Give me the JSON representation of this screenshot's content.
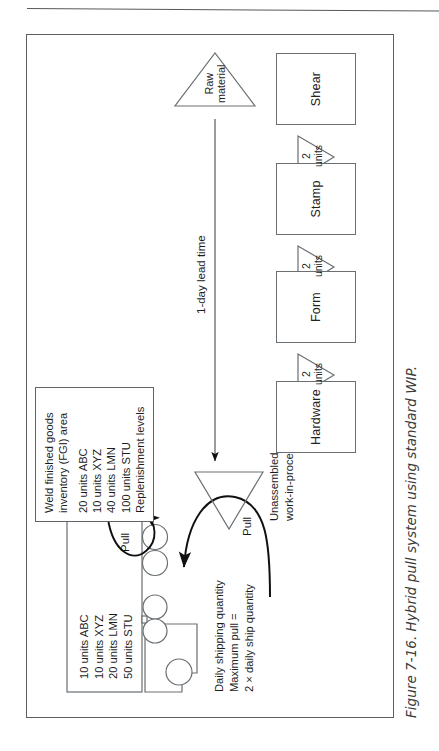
{
  "figure": {
    "caption": "Figure 7-16. Hybrid pull system using standard WIP."
  },
  "truck": {
    "icon": "delivery-truck-icon",
    "trailer_lines": [
      "10 units ABC",
      "10 units XYZ",
      "20 units LMN",
      "50 units STU"
    ]
  },
  "shipping_note": {
    "lines": [
      "Daily shipping quantity",
      "Maximum pull =",
      "2 × daily ship quantity"
    ]
  },
  "fgi_box": {
    "title_lines": [
      "Weld finished goods",
      "inventory (FGI) area"
    ],
    "levels": [
      "20 units ABC",
      "10 units XYZ",
      "40 units LMN",
      "100 units STU"
    ],
    "footer": "Replenishment levels"
  },
  "pull_arrows": [
    {
      "label": "Pull",
      "name": "pull-arrow-shipping"
    },
    {
      "label": "Pull",
      "name": "pull-arrow-fgi"
    }
  ],
  "wip_triangle": {
    "label_lines": [
      "Unassembled",
      "work-in-process (WIP)"
    ]
  },
  "raw_material": {
    "label_lines": [
      "Raw",
      "material"
    ]
  },
  "lead_time": {
    "label": "1-day lead time"
  },
  "processes": [
    {
      "label": "Shear"
    },
    {
      "label": "Stamp"
    },
    {
      "label": "Form"
    },
    {
      "label": "Hardware"
    }
  ],
  "buffers": [
    {
      "qty": "2",
      "unit": "units"
    },
    {
      "qty": "2",
      "unit": "units"
    },
    {
      "qty": "2",
      "unit": "units"
    }
  ],
  "colors": {
    "line": "#6a6f73",
    "frame": "#5a5f63",
    "text": "#1c1c1c",
    "arrow": "#111111"
  }
}
